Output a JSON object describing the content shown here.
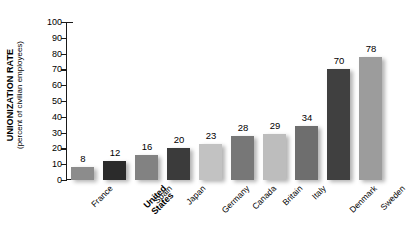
{
  "chart_data": {
    "type": "bar",
    "title": "",
    "xlabel": "",
    "ylabel": "UNIONIZATION RATE",
    "ylabel_sub": "(percent of civilian employees)",
    "ylim": [
      0,
      100
    ],
    "yticks": [
      100,
      90,
      80,
      70,
      60,
      50,
      40,
      30,
      20,
      10,
      0
    ],
    "grid": false,
    "legend": "none",
    "categories": [
      "France",
      "United States",
      "Spain",
      "Japan",
      "Germany",
      "Canada",
      "Britain",
      "Italy",
      "Denmark",
      "Sweden"
    ],
    "values": [
      8,
      12,
      16,
      20,
      23,
      28,
      29,
      34,
      70,
      78
    ],
    "value_labels": [
      "8",
      "12",
      "16",
      "20",
      "23",
      "28",
      "29",
      "34",
      "70",
      "78"
    ],
    "bar_colors": [
      "#8c8c8c",
      "#2b2b2b",
      "#828282",
      "#3b3b3b",
      "#c2c2c2",
      "#777777",
      "#bdbdbd",
      "#6e6e6e",
      "#404040",
      "#9c9c9c"
    ],
    "highlighted_category": "United States",
    "highlight_lines": [
      "United",
      "States"
    ]
  }
}
